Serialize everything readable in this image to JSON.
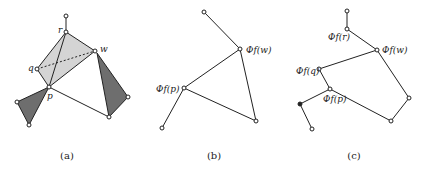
{
  "panels": [
    {
      "id": "a",
      "caption": "(a)",
      "labels": {
        "r": "r",
        "w": "w",
        "q": "q",
        "p": "p"
      }
    },
    {
      "id": "b",
      "caption": "(b)",
      "labels": {
        "w": "Φf(w)",
        "p": "Φf(p)"
      }
    },
    {
      "id": "c",
      "caption": "(c)",
      "labels": {
        "r": "Φf(r)",
        "w": "Φf(w)",
        "q": "Φf(q)",
        "p": "Φf(p)"
      }
    }
  ],
  "colors": {
    "light_fill": "#d4d4d4",
    "dark_fill": "#6e6e6e",
    "stroke": "#222222"
  }
}
